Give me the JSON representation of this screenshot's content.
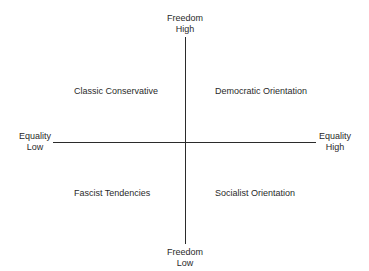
{
  "axes": {
    "vertical": {
      "dimension": "Freedom",
      "top_label": [
        "Freedom",
        "High"
      ],
      "bottom_label": [
        "Freedom",
        "Low"
      ]
    },
    "horizontal": {
      "dimension": "Equality",
      "left_label": [
        "Equality",
        "Low"
      ],
      "right_label": [
        "Equality",
        "High"
      ]
    }
  },
  "quadrants": {
    "top_left": "Classic Conservative",
    "top_right": "Democratic Orientation",
    "bottom_left": "Fascist Tendencies",
    "bottom_right": "Socialist Orientation"
  },
  "colors": {
    "axis": "#2b2b2b",
    "text": "#2a2a2a",
    "background": "#ffffff"
  }
}
